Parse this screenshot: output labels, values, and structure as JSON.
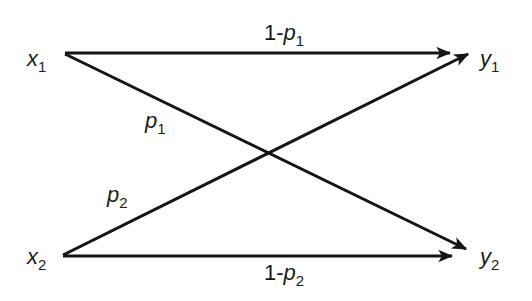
{
  "diagram": {
    "type": "binary channel transition diagram",
    "colors": {
      "line": "#151515",
      "text": "#1a1a1a",
      "background": "#ffffff"
    },
    "nodes": {
      "x1": {
        "base": "x",
        "sub": "1"
      },
      "x2": {
        "base": "x",
        "sub": "2"
      },
      "y1": {
        "base": "y",
        "sub": "1"
      },
      "y2": {
        "base": "y",
        "sub": "2"
      }
    },
    "edges": [
      {
        "from": "x1",
        "to": "y1",
        "prefix": "1-",
        "base": "p",
        "sub": "1"
      },
      {
        "from": "x1",
        "to": "y2",
        "prefix": "",
        "base": "p",
        "sub": "1"
      },
      {
        "from": "x2",
        "to": "y1",
        "prefix": "",
        "base": "p",
        "sub": "2"
      },
      {
        "from": "x2",
        "to": "y2",
        "prefix": "1-",
        "base": "p",
        "sub": "2"
      }
    ]
  }
}
